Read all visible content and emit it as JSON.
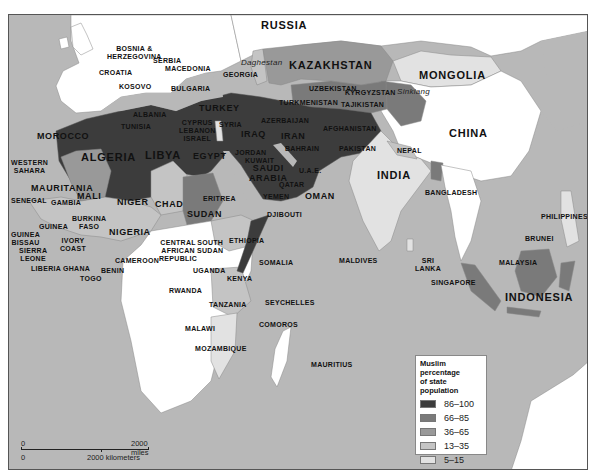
{
  "map": {
    "title": "Muslim percentage of state population",
    "colors": {
      "water": "#b8b8b8",
      "land_non_muslim": "#ffffff",
      "cat_86_100": "#3c3c3c",
      "cat_66_85": "#7a7a7a",
      "cat_36_65": "#999999",
      "cat_13_35": "#c4c4c4",
      "cat_5_15": "#e2e2e2"
    },
    "labels": {
      "russia": "RUSSIA",
      "kazakhstan": "KAZAKHSTAN",
      "mongolia": "MONGOLIA",
      "china": "CHINA",
      "daghestan": "Daghestan",
      "sinkiang": "Sinkiang",
      "bosnia": "BOSNIA &",
      "herzegovina": "HERZEGOVINA",
      "serbia": "SERBIA",
      "croatia": "CROATIA",
      "macedonia": "MACEDONIA",
      "kosovo": "KOSOVO",
      "bulgaria": "BULGARIA",
      "georgia": "GEORGIA",
      "albania": "ALBANIA",
      "uzbekistan": "UZBEKISTAN",
      "kyrgyzstan": "KYRGYZSTAN",
      "turkmenistan": "TURKMENISTAN",
      "tajikistan": "TAJIKISTAN",
      "turkey": "TURKEY",
      "tunisia": "TUNISIA",
      "morocco": "MOROCCO",
      "cyprus": "CYPRUS",
      "lebanon": "LEBANON",
      "israel": "ISRAEL",
      "syria": "SYRIA",
      "azerbaijan": "AZERBAIJAN",
      "iraq": "IRAQ",
      "iran": "IRAN",
      "afghanistan": "AFGHANISTAN",
      "algeria": "ALGERIA",
      "libya": "LIBYA",
      "egypt": "EGYPT",
      "jordan": "JORDAN",
      "kuwait": "KUWAIT",
      "bahrain": "BAHRAIN",
      "pakistan": "PAKISTAN",
      "saudi_arabia_1": "SAUDI",
      "saudi_arabia_2": "ARABIA",
      "uae": "U.A.E.",
      "qatar": "QATAR",
      "oman": "OMAN",
      "nepal": "NEPAL",
      "india": "INDIA",
      "western_sahara_1": "WESTERN",
      "western_sahara_2": "SAHARA",
      "mauritania": "MAURITANIA",
      "mali": "MALI",
      "senegal": "SENEGAL",
      "gambia": "GAMBIA",
      "niger": "NIGER",
      "chad": "CHAD",
      "sudan": "SUDAN",
      "eritrea": "ERITREA",
      "yemen": "YEMEN",
      "bangladesh": "BANGLADESH",
      "djibouti": "DJIBOUTI",
      "guinea": "GUINEA",
      "burkina_1": "BURKINA",
      "burkina_2": "FASO",
      "nigeria": "NIGERIA",
      "guinea_bissau_1": "GUINEA",
      "guinea_bissau_2": "BISSAU",
      "ivory_1": "IVORY",
      "ivory_2": "COAST",
      "sierra_1": "SIERRA",
      "sierra_2": "LEONE",
      "liberia": "LIBERIA",
      "ghana": "GHANA",
      "togo": "TOGO",
      "benin": "BENIN",
      "cameroon": "CAMEROON",
      "car_1": "CENTRAL",
      "car_2": "AFRICAN",
      "car_3": "REPUBLIC",
      "south_sudan_1": "SOUTH",
      "south_sudan_2": "SUDAN",
      "ethiopia": "ETHIOPIA",
      "somalia": "SOMALIA",
      "maldives": "MALDIVES",
      "sri_lanka_1": "SRI",
      "sri_lanka_2": "LANKA",
      "philippines": "PHILIPPINES",
      "brunei": "BRUNEI",
      "malaysia": "MALAYSIA",
      "singapore": "SINGAPORE",
      "indonesia": "INDONESIA",
      "uganda": "UGANDA",
      "kenya": "KENYA",
      "rwanda": "RWANDA",
      "tanzania": "TANZANIA",
      "seychelles": "SEYCHELLES",
      "malawi": "MALAWI",
      "comoros": "COMOROS",
      "mozambique": "MOZAMBIQUE",
      "mauritius": "MAURITIUS"
    }
  },
  "legend": {
    "title_line1": "Muslim percentage",
    "title_line2": "of state population",
    "items": [
      {
        "range": "86–100",
        "color": "#3c3c3c"
      },
      {
        "range": "66–85",
        "color": "#7a7a7a"
      },
      {
        "range": "36–65",
        "color": "#999999"
      },
      {
        "range": "13–35",
        "color": "#c4c4c4"
      },
      {
        "range": "5–15",
        "color": "#e2e2e2"
      }
    ]
  },
  "scale": {
    "zero_top": "0",
    "zero_bottom": "0",
    "miles_label": "2000 miles",
    "km_label": "2000 kilometers"
  }
}
